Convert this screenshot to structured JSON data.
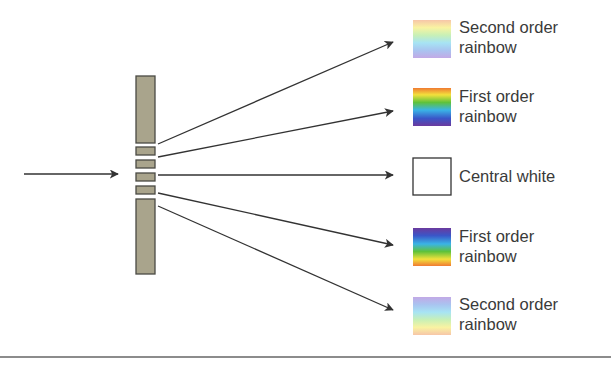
{
  "diagram": {
    "incident_beam": "incoming light",
    "orders": [
      {
        "id": "second-order-top",
        "line1": "Second order",
        "line2": "rainbow",
        "swatch": "pastel-red-to-violet"
      },
      {
        "id": "first-order-top",
        "line1": "First order",
        "line2": "rainbow",
        "swatch": "vivid-red-to-violet"
      },
      {
        "id": "central",
        "line1": "Central white",
        "line2": "",
        "swatch": "white"
      },
      {
        "id": "first-order-bottom",
        "line1": "First order",
        "line2": "rainbow",
        "swatch": "vivid-violet-to-red"
      },
      {
        "id": "second-order-bottom",
        "line1": "Second order",
        "line2": "rainbow",
        "swatch": "pastel-violet-to-red"
      }
    ],
    "colors": {
      "grating_fill": "#a9a48c",
      "grating_stroke": "#4a4a44",
      "arrow": "#333333",
      "text": "#3a3a3a",
      "rule": "#8c8c8c"
    }
  }
}
